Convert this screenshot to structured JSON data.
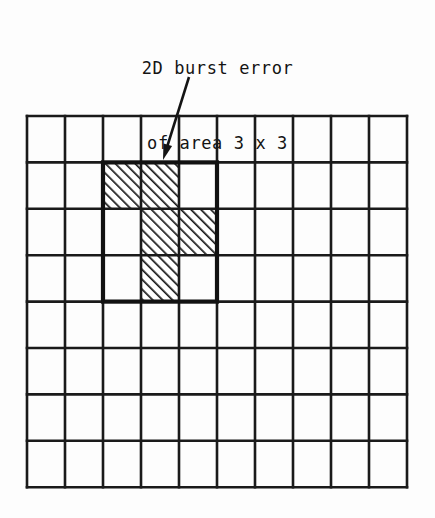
{
  "caption": {
    "line1": "2D burst error",
    "line2": "of area 3 x 3"
  },
  "colors": {
    "background": "#fdfdfd",
    "ink": "#141414",
    "grid_line": "#1a1a1a",
    "hatch": "#1a1a1a",
    "cell_fill": "#ffffff"
  },
  "diagram": {
    "type": "grid-illustration",
    "label": "2D burst error of area 3 x 3",
    "grid": {
      "columns": 10,
      "rows": 8,
      "origin_x": 27,
      "origin_y": 116,
      "cell_width": 38,
      "cell_height": 46.4,
      "line_width": 2.6,
      "line_color": "#1a1a1a"
    },
    "burst_box": {
      "label": "burst-region-3x3",
      "col_start": 2,
      "row_start": 1,
      "col_span": 3,
      "row_span": 3,
      "line_width": 4.2,
      "line_color": "#111111"
    },
    "error_cells": [
      {
        "row": 1,
        "col": 2
      },
      {
        "row": 1,
        "col": 3
      },
      {
        "row": 2,
        "col": 3
      },
      {
        "row": 2,
        "col": 4
      },
      {
        "row": 3,
        "col": 3
      }
    ],
    "hatch": {
      "direction": "forward-slash",
      "angle_deg": 45,
      "spacing": 7,
      "stroke_width": 3.4
    },
    "arrow": {
      "label": "callout-arrow",
      "x1": 189,
      "y1": 77,
      "x2": 163,
      "y2": 160,
      "stroke_width": 2.6,
      "head_length": 16,
      "head_width": 9
    }
  }
}
